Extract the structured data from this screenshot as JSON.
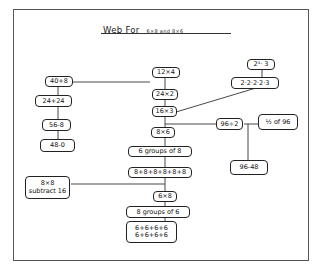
{
  "title": {
    "main": "Web  For",
    "sub": "6×8 and 8×6"
  },
  "nodes": {
    "n40p8": "40+8",
    "n24p24": "24+24",
    "n56m8": "56-8",
    "n48m0": "48-0",
    "n12x4": "12×4",
    "n24x2": "24×2",
    "n16x3": "16×3",
    "n8x6": "8×6",
    "n6groups8": "6 groups of 8",
    "n8sum": "8+8+8+8+8+8",
    "n6x8": "6×8",
    "n8groups6": "8 groups of 6",
    "n6sum_line1": "6+6+6+6",
    "n6sum_line2": "6+6+6+6",
    "n8x8_line1": "8×8",
    "n8x8_line2": "subtract 16",
    "n2pow4x3": "2⁴· 3",
    "n2x2x2x2x3": "2·2·2·2·3",
    "n96div2": "96÷2",
    "nhalf96": "½ of 96",
    "n96m48": "96-48"
  }
}
